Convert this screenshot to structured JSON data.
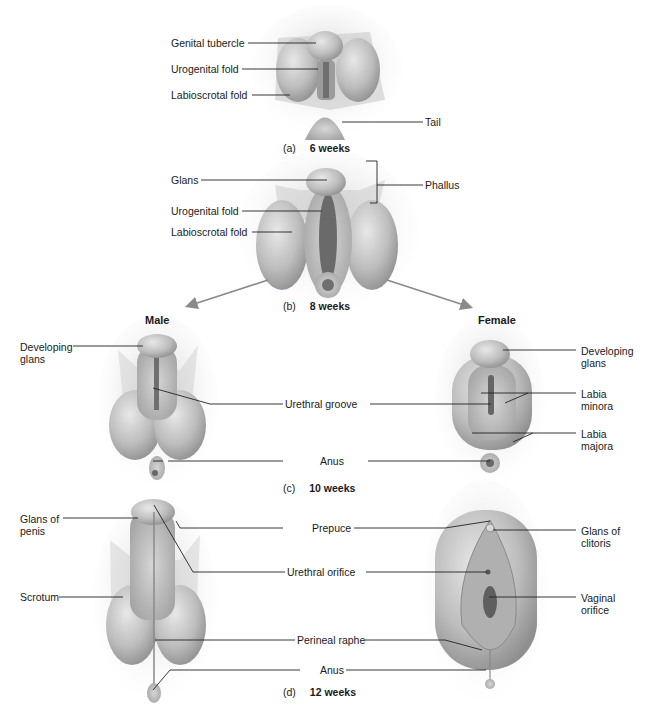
{
  "figure": {
    "panels": [
      {
        "id": "a",
        "letter": "(a)",
        "age": "6 weeks",
        "labels": [
          "Genital tubercle",
          "Urogenital fold",
          "Labioscrotal fold",
          "Tail"
        ]
      },
      {
        "id": "b",
        "letter": "(b)",
        "age": "8 weeks",
        "labels": [
          "Glans",
          "Urogenital fold",
          "Labioscrotal fold",
          "Phallus"
        ]
      },
      {
        "id": "c",
        "letter": "(c)",
        "age": "10 weeks",
        "male_labels": [
          "Developing\nglans"
        ],
        "shared_labels": [
          "Urethral groove",
          "Anus"
        ],
        "female_labels": [
          "Developing\nglans",
          "Labia\nminora",
          "Labia\nmajora"
        ]
      },
      {
        "id": "d",
        "letter": "(d)",
        "age": "12 weeks",
        "male_labels": [
          "Glans of\npenis",
          "Scrotum"
        ],
        "shared_labels": [
          "Prepuce",
          "Urethral orifice",
          "Perineal raphe",
          "Anus"
        ],
        "female_labels": [
          "Glans of\nclitoris",
          "Vaginal\norifice"
        ]
      }
    ],
    "branches": {
      "male": "Male",
      "female": "Female"
    },
    "colors": {
      "tissue_light": "#d9d9d9",
      "tissue_mid": "#b5b5b5",
      "tissue_dark": "#7a7a7a",
      "leader_line": "#222222",
      "arrow": "#8a8a8a"
    }
  }
}
